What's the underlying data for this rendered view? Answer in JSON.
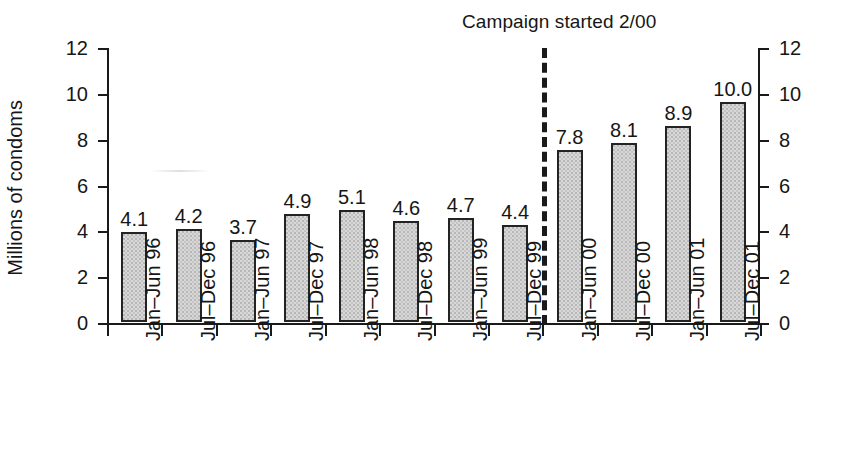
{
  "figure": {
    "annotation": "Campaign started 2/00",
    "y_axis_title": "Millions of condoms",
    "background": "#ffffff",
    "ink_color": "#1a1a1a",
    "bar_fill": "#d8d8d8",
    "bar_edge": "#232323"
  },
  "chart_data": {
    "type": "bar",
    "title": "",
    "subtitle": "",
    "xlabel": "",
    "ylabel": "Millions of condoms",
    "ylim": [
      0,
      12
    ],
    "yticks": [
      0,
      2,
      4,
      6,
      8,
      10,
      12
    ],
    "ytick_labels": [
      "0",
      "2",
      "4",
      "6",
      "8",
      "10",
      "12"
    ],
    "grid": false,
    "legend": null,
    "dual_axis": true,
    "right_axis_ticks": [
      0,
      2,
      4,
      6,
      8,
      10,
      12
    ],
    "right_axis_tick_labels": [
      "0",
      "2",
      "4",
      "6",
      "8",
      "10",
      "12"
    ],
    "categories": [
      "Jan–Jun 96",
      "Jul–Dec 96",
      "Jan–Jun 97",
      "Jul–Dec 97",
      "Jan–Jun 98",
      "Jul–Dec 98",
      "Jan–Jun 99",
      "Jul–Dec 99",
      "Jan–Jun 00",
      "Jul–Dec 00",
      "Jan–Jun 01",
      "Jul–Dec 01"
    ],
    "values": [
      4.1,
      4.2,
      3.7,
      4.9,
      5.1,
      4.6,
      4.7,
      4.4,
      7.8,
      8.1,
      8.9,
      10.0
    ],
    "data_labels": [
      "4.1",
      "4.2",
      "3.7",
      "4.9",
      "5.1",
      "4.6",
      "4.7",
      "4.4",
      "7.8",
      "8.1",
      "8.9",
      "10.0"
    ],
    "annotations": [
      {
        "text": "Campaign started 2/00",
        "type": "vertical-dashed-line",
        "between_categories": [
          "Jul–Dec 99",
          "Jan–Jun 00"
        ]
      }
    ]
  }
}
